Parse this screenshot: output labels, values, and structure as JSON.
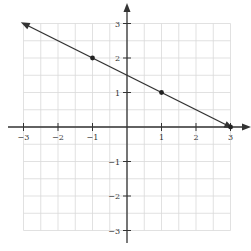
{
  "chart_data": {
    "type": "line",
    "title": "",
    "xlabel": "",
    "ylabel": "",
    "xlim": [
      -3,
      3
    ],
    "ylim": [
      -3,
      3
    ],
    "grid": true,
    "grid_step": 0.5,
    "x_ticks": [
      -3,
      -2,
      -1,
      1,
      2,
      3
    ],
    "y_ticks": [
      3,
      2,
      1,
      -1,
      -2,
      -3
    ],
    "x_tick_labels": [
      "−3",
      "−2",
      "−1",
      "1",
      "2",
      "3"
    ],
    "y_tick_labels": [
      "3",
      "2",
      "1",
      "−1",
      "−2",
      "−3"
    ],
    "series": [
      {
        "name": "line",
        "x": [
          -3,
          3
        ],
        "y": [
          3,
          0
        ],
        "color": "#333333",
        "arrows": "both"
      }
    ],
    "points": [
      {
        "x": -1,
        "y": 2
      },
      {
        "x": 1,
        "y": 1
      },
      {
        "x": 3,
        "y": 0
      }
    ]
  }
}
